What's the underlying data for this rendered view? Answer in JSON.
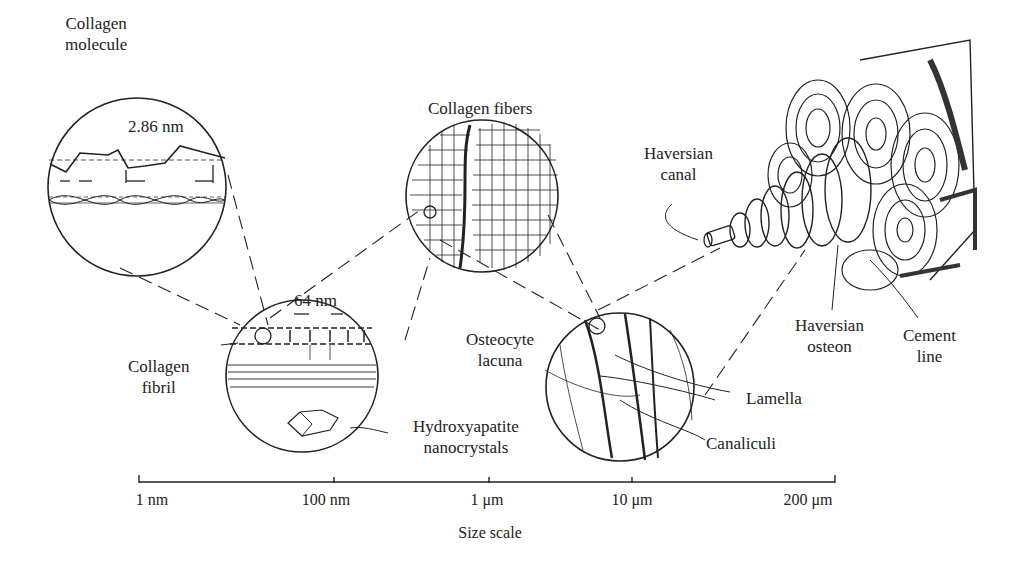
{
  "diagram": {
    "labels": {
      "collagen_molecule": "Collagen\nmolecule",
      "molecule_spacing": "2.86 nm",
      "collagen_fibers": "Collagen fibers",
      "fibril_period": "64 nm",
      "collagen_fibril": "Collagen\nfibril",
      "hydroxyapatite": "Hydroxyapatite\nnanocrystals",
      "osteocyte_lacuna": "Osteocyte\nlacuna",
      "lamella": "Lamella",
      "canaliculi": "Canaliculi",
      "haversian_canal": "Haversian\ncanal",
      "haversian_osteon": "Haversian\nosteon",
      "cement_line": "Cement\nline"
    },
    "scale": {
      "ticks": [
        "1 nm",
        "100 nm",
        "1 μm",
        "10 μm",
        "200 μm"
      ],
      "title": "Size scale"
    }
  }
}
